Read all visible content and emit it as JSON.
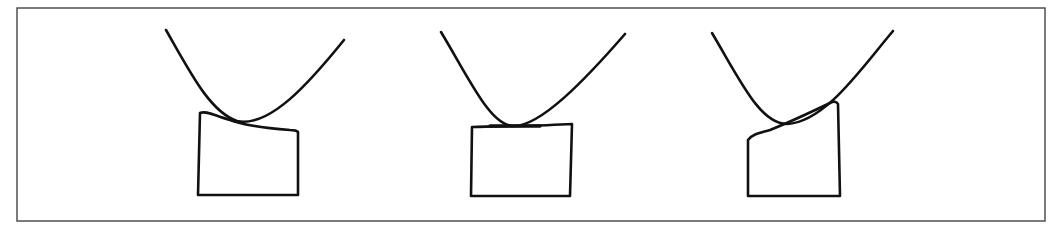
{
  "figure": {
    "colors": {
      "stroke": "#111111",
      "frame": "#444444",
      "background": "#ffffff"
    },
    "panels": [
      {
        "id": "left",
        "contact": "block top slopes downward to the right"
      },
      {
        "id": "center",
        "contact": "block top flat, curve tangent at center"
      },
      {
        "id": "right",
        "contact": "block top slopes upward to the right"
      }
    ]
  }
}
